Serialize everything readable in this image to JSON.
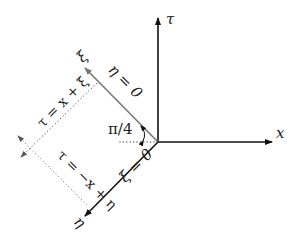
{
  "diagram": {
    "type": "coordinate-axes",
    "axes": {
      "tau": {
        "label": "τ",
        "color": "#111111"
      },
      "x": {
        "label": "x",
        "color": "#111111"
      },
      "xi": {
        "label": "ξ",
        "color": "#777777",
        "line_label": "η = 0"
      },
      "eta": {
        "label": "η",
        "color": "#111111",
        "line_label": "ξ = 0"
      }
    },
    "angle_label": "π/4",
    "dotted_lines": [
      {
        "label": "τ = x + ξ"
      },
      {
        "label": "τ = −x + η"
      }
    ]
  }
}
